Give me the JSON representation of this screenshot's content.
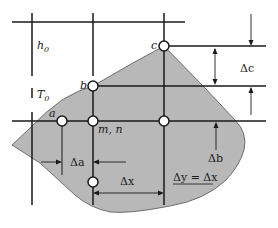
{
  "diagram": {
    "type": "finite-difference grid over irregular region",
    "colors": {
      "region_fill": "#b8b8b8",
      "line": "#1a1a1a",
      "node_fill": "#ffffff",
      "background": "#ffffff"
    },
    "labels": {
      "h0": "h",
      "h0_sub": "0",
      "T0": "T",
      "T0_sub": "0",
      "a": "a",
      "b": "b",
      "c": "c",
      "mn": "m, n",
      "delta_a": "Δa",
      "delta_b": "Δb",
      "delta_c": "Δc",
      "delta_x": "Δx",
      "delta_y_eq": "Δy = Δx"
    },
    "nodes": [
      {
        "id": "c",
        "x": 164,
        "y": 46
      },
      {
        "id": "b",
        "x": 93,
        "y": 86
      },
      {
        "id": "a",
        "x": 62,
        "y": 121
      },
      {
        "id": "m,n",
        "x": 93,
        "y": 121
      },
      {
        "id": "right",
        "x": 164,
        "y": 121
      },
      {
        "id": "bottom",
        "x": 93,
        "y": 182
      }
    ]
  }
}
